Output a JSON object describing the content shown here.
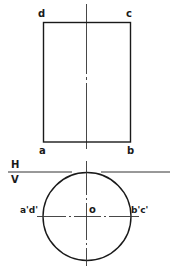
{
  "diagram": {
    "type": "orthographic-projection",
    "front_view": {
      "shape": "rectangle",
      "corners": {
        "top_left": "d",
        "top_right": "c",
        "bottom_left": "a",
        "bottom_right": "b"
      }
    },
    "reference_line": {
      "above": "H",
      "below": "V"
    },
    "top_view": {
      "shape": "circle",
      "center_label": "o",
      "left_label": "a'd'",
      "right_label": "b'c'"
    },
    "colors": {
      "stroke": "#1a1a1a",
      "background": "#ffffff"
    }
  }
}
